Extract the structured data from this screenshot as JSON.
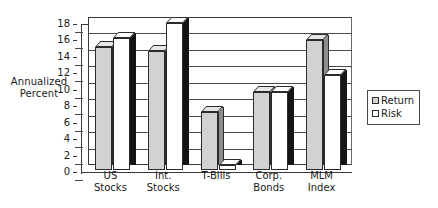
{
  "chart_data": {
    "type": "bar",
    "title": "",
    "xlabel": "",
    "ylabel": "Annualized Percent",
    "ylabel_lines": [
      "Annualized",
      "Percent"
    ],
    "categories": [
      "US Stocks",
      "Int. Stocks",
      "T-Bills",
      "Corp. Bonds",
      "MLM Index"
    ],
    "category_lines": [
      [
        "US",
        "Stocks"
      ],
      [
        "Int.",
        "Stocks"
      ],
      [
        "T-Bills",
        ""
      ],
      [
        "Corp.",
        "Bonds"
      ],
      [
        "MLM",
        "Index"
      ]
    ],
    "series": [
      {
        "name": "Return",
        "values": [
          15.0,
          14.5,
          7.0,
          9.5,
          15.8
        ],
        "color": "#d2d2d2"
      },
      {
        "name": "Risk",
        "values": [
          16.0,
          17.9,
          0.6,
          9.5,
          11.5
        ],
        "color": "#ffffff"
      }
    ],
    "ylim": [
      0,
      18
    ],
    "ytick_values": [
      18,
      16,
      14,
      12,
      10,
      8,
      6,
      4,
      2,
      0
    ],
    "ytick_labels": [
      "18",
      "16",
      "14",
      "12",
      "10",
      "8",
      "6",
      "4",
      "2",
      "0"
    ],
    "grid": true,
    "grid_axis": "y",
    "legend": [
      "Return",
      "Risk"
    ],
    "legend_position": "right",
    "style": "3d-clustered-column"
  },
  "legend": {
    "items": [
      {
        "label": "Return",
        "swatch": "gray-swatch-icon"
      },
      {
        "label": "Risk",
        "swatch": "white-swatch-icon"
      }
    ]
  }
}
